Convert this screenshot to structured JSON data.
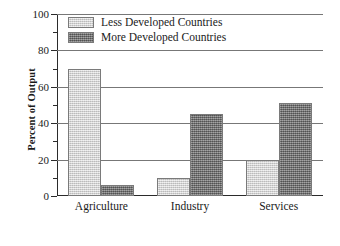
{
  "chart_data": {
    "type": "bar",
    "title": "",
    "subtitle": "",
    "xlabel": "",
    "ylabel": "Percent of Output",
    "categories": [
      "Agriculture",
      "Industry",
      "Services"
    ],
    "series": [
      {
        "name": "Less Developed Countries",
        "color": "#cfcfcf",
        "values": [
          70,
          10,
          20
        ]
      },
      {
        "name": "More Developed Countries",
        "color": "#777777",
        "values": [
          6,
          45,
          51
        ]
      }
    ],
    "ylim": [
      0,
      100
    ],
    "ytick_labels": [
      "0",
      "20",
      "40",
      "60",
      "80",
      "100"
    ],
    "ytick_values": [
      0,
      20,
      40,
      60,
      80,
      100
    ],
    "yminor_values": [
      10,
      30,
      50,
      70,
      90
    ],
    "grid": "horizontal-major",
    "legend_position": "top-left-inside"
  },
  "legend": {
    "entries": [
      {
        "label": "Less Developed Countries",
        "swatch": "light-gray-swatch"
      },
      {
        "label": "More Developed Countries",
        "swatch": "dark-gray-swatch"
      }
    ]
  },
  "axes": {
    "y_title": "Percent of Output",
    "y_labels": [
      "100",
      "80",
      "60",
      "40",
      "20",
      "0"
    ],
    "x_labels": [
      "Agriculture",
      "Industry",
      "Services"
    ]
  }
}
